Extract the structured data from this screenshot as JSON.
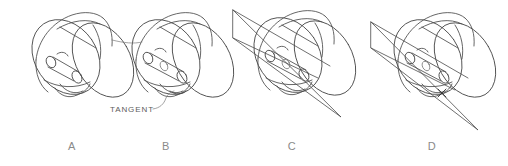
{
  "figure": {
    "background_color": "#ffffff",
    "line_color": "#4a4a4a",
    "text_color": "#8a8a8a",
    "callout_color": "#5d5d5d"
  },
  "panels": [
    {
      "id": "a",
      "label": "A",
      "label_x": 72,
      "label_y": 150,
      "description": "Cylinder with elliptical end disc and short protruding shaft"
    },
    {
      "id": "b",
      "label": "B",
      "label_x": 166,
      "label_y": 150,
      "description": "Cylinder with longer shaft and tangent arc called out"
    },
    {
      "id": "c",
      "label": "C",
      "label_x": 292,
      "label_y": 150,
      "description": "Cylinder with triangular cutting plane passing through"
    },
    {
      "id": "d",
      "label": "D",
      "label_x": 432,
      "label_y": 150,
      "description": "Cylinder with cutting plane and intersection point marked"
    }
  ],
  "callouts": [
    {
      "id": "tangent",
      "text": "TANGENT",
      "x": 110,
      "y": 112,
      "target_x": 160,
      "target_y": 90
    }
  ],
  "marks": [
    {
      "id": "intersection-cross",
      "symbol": "x",
      "x": 442,
      "y": 93
    }
  ]
}
